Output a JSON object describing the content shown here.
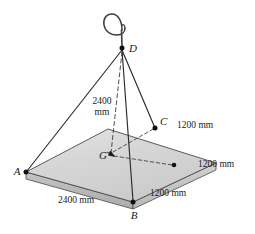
{
  "figure": {
    "type": "engineering-statics-diagram",
    "background_color": "#ffffff"
  },
  "colors": {
    "line": "#2b2b2b",
    "plate_top": "#d2d2d2",
    "plate_top_light": "#e2e2e2",
    "plate_edge_front": "#b4b4b4",
    "plate_edge_right": "#c6c6c6",
    "plate_outline": "#4a4a4a",
    "dashed": "#3a3a3a",
    "text": "#1a1a1a",
    "hook": "#4a4a4a"
  },
  "points": {
    "A": {
      "label": "A",
      "x": 26,
      "y": 172
    },
    "B": {
      "label": "B",
      "x": 133,
      "y": 202
    },
    "C": {
      "label": "C",
      "x": 155,
      "y": 128
    },
    "D": {
      "label": "D",
      "x": 122,
      "y": 48
    },
    "G": {
      "label": "G",
      "x": 111,
      "y": 155
    },
    "M": {
      "label": "",
      "x": 174,
      "y": 165
    }
  },
  "point_labels": {
    "A": "A",
    "B": "B",
    "C": "C",
    "D": "D",
    "G": "G"
  },
  "dimensions": {
    "cable_height_line1": "2400",
    "cable_height_line2": "mm",
    "cable_height_full": "2400 mm",
    "bottom_left_edge": "2400 mm",
    "upper_right_edge": "1200 mm",
    "middle_right_edge": "1200 mm",
    "lower_right_edge": "1200 mm"
  },
  "icons": {
    "hook": "crane-hook-icon"
  }
}
